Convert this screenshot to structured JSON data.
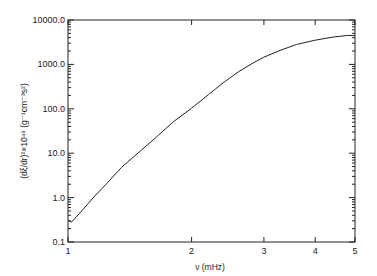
{
  "chart_data": {
    "type": "line",
    "title": "",
    "xlabel": "ν (mHz)",
    "ylabel": "(dξ/dr)²×10⁴⁹  (g⁻¹cm⁻³s²)",
    "x_scale": "log",
    "y_scale": "log",
    "xlim": [
      1,
      5
    ],
    "ylim": [
      0.1,
      10000
    ],
    "x_ticks": [
      1,
      2,
      3,
      4,
      5
    ],
    "x_tick_labels": [
      "1",
      "2",
      "3",
      "4",
      "5"
    ],
    "y_ticks": [
      0.1,
      1,
      10,
      100,
      1000,
      10000
    ],
    "y_tick_labels": [
      "0.1",
      "1.0",
      "10.0",
      "100.0",
      "1000.0",
      "10000.0"
    ],
    "grid": false,
    "legend": null,
    "series": [
      {
        "name": "(dξ/dr)²",
        "x": [
          1.0,
          1.02,
          1.08,
          1.15,
          1.25,
          1.35,
          1.51,
          1.65,
          1.8,
          2.0,
          2.2,
          2.4,
          2.6,
          2.8,
          3.0,
          3.3,
          3.6,
          4.0,
          4.4,
          4.8,
          5.0
        ],
        "values": [
          0.31,
          0.28,
          0.5,
          0.98,
          2.2,
          4.8,
          11.8,
          24,
          50,
          103,
          210,
          400,
          680,
          1030,
          1450,
          2100,
          2800,
          3500,
          4100,
          4500,
          4450
        ]
      }
    ]
  }
}
